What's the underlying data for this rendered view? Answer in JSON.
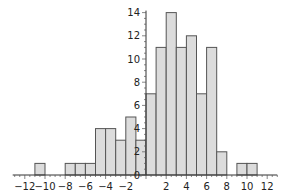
{
  "chart_data": {
    "type": "bar",
    "subtype": "histogram",
    "title": "",
    "xlabel": "",
    "ylabel": "",
    "bin_width": 1,
    "bins": [
      {
        "x0": -11,
        "x1": -10,
        "count": 1
      },
      {
        "x0": -8,
        "x1": -7,
        "count": 1
      },
      {
        "x0": -7,
        "x1": -6,
        "count": 1
      },
      {
        "x0": -6,
        "x1": -5,
        "count": 1
      },
      {
        "x0": -5,
        "x1": -4,
        "count": 4
      },
      {
        "x0": -4,
        "x1": -3,
        "count": 4
      },
      {
        "x0": -3,
        "x1": -2,
        "count": 3
      },
      {
        "x0": -2,
        "x1": -1,
        "count": 5
      },
      {
        "x0": -1,
        "x1": 0,
        "count": 3
      },
      {
        "x0": 0,
        "x1": 1,
        "count": 7
      },
      {
        "x0": 1,
        "x1": 2,
        "count": 11
      },
      {
        "x0": 2,
        "x1": 3,
        "count": 14
      },
      {
        "x0": 3,
        "x1": 4,
        "count": 11
      },
      {
        "x0": 4,
        "x1": 5,
        "count": 12
      },
      {
        "x0": 5,
        "x1": 6,
        "count": 7
      },
      {
        "x0": 6,
        "x1": 7,
        "count": 11
      },
      {
        "x0": 7,
        "x1": 8,
        "count": 2
      },
      {
        "x0": 9,
        "x1": 10,
        "count": 1
      },
      {
        "x0": 10,
        "x1": 11,
        "count": 1
      }
    ],
    "x_ticks": [
      -12,
      -10,
      -8,
      -6,
      -4,
      -2,
      2,
      4,
      6,
      8,
      10,
      12
    ],
    "x_tick_labels": [
      "−12",
      "−10",
      "−8",
      "−6",
      "−4",
      "−2",
      "2",
      "4",
      "6",
      "8",
      "10",
      "12"
    ],
    "y_ticks": [
      2,
      4,
      6,
      8,
      10,
      12,
      14
    ],
    "y_tick_labels": [
      "2",
      "4",
      "6",
      "8",
      "10",
      "12",
      "14"
    ],
    "origin_label": "0",
    "xlim": [
      -13,
      13
    ],
    "ylim": [
      0,
      14
    ],
    "grid": false,
    "legend": null,
    "colors": {
      "bar_fill": "#dcdcdc",
      "bar_stroke": "#555555",
      "axis": "#333333"
    }
  }
}
